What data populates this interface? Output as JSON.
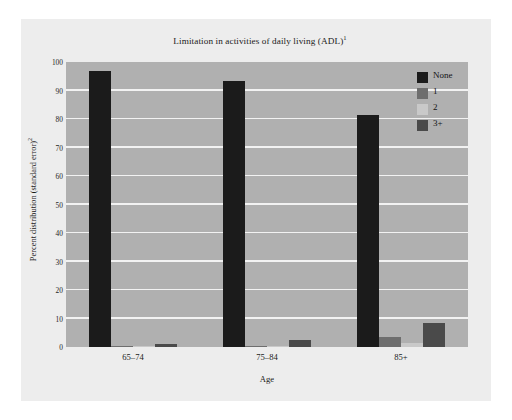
{
  "figure": {
    "background_color": "#ffffff",
    "card_color": "#ededed",
    "plot_background_color": "#b0b0b0",
    "gridline_color": "#f2f2f2"
  },
  "chart_data": {
    "type": "bar",
    "title": "Limitation in activities of daily living (ADL)",
    "title_superscript": "1",
    "subtitle": "",
    "xlabel": "Age",
    "ylabel": "Percent distribution (standard error)",
    "ylabel_superscript": "2",
    "categories": [
      "65–74",
      "75–84",
      "85+"
    ],
    "series": [
      {
        "name": "None",
        "color": "#1b1b1b",
        "values": [
          97.0,
          93.5,
          81.5
        ]
      },
      {
        "name": "1",
        "color": "#6e6e6e",
        "values": [
          0.3,
          0.5,
          3.5
        ]
      },
      {
        "name": "2",
        "color": "#c9c9c9",
        "values": [
          0.1,
          0.2,
          1.5
        ]
      },
      {
        "name": "3+",
        "color": "#4a4a4a",
        "values": [
          1.0,
          2.3,
          8.5
        ]
      }
    ],
    "ylim": [
      0,
      100
    ],
    "yticks": [
      0,
      10,
      20,
      30,
      40,
      50,
      60,
      70,
      80,
      90,
      100
    ],
    "ytick_labels": [
      "0",
      "10",
      "20",
      "30",
      "40",
      "50",
      "60",
      "70",
      "80",
      "90",
      "100"
    ],
    "grid": true,
    "grid_axis": "y",
    "legend_position": "top-right",
    "legend_entries": [
      "None",
      "1",
      "2",
      "3+"
    ]
  }
}
